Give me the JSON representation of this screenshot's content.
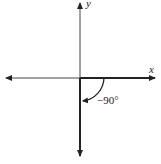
{
  "diagram": {
    "type": "coordinate-plane-angle",
    "axes": {
      "x_label": "x",
      "y_label": "y"
    },
    "angle": {
      "label": "−90°",
      "value_degrees": -90,
      "initial_side": "positive x-axis",
      "terminal_side": "negative y-axis",
      "direction": "clockwise"
    },
    "colors": {
      "line": "#222222",
      "background": "#ffffff"
    }
  }
}
